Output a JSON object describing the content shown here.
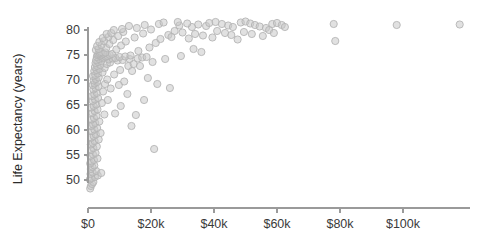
{
  "chart_data": {
    "type": "scatter",
    "title": "",
    "xlabel": "",
    "ylabel": "Life Expectancy (years)",
    "xlim": [
      -4000,
      123000
    ],
    "ylim": [
      46.5,
      82.5
    ],
    "grid": false,
    "legend": "none",
    "xticks": [
      0,
      20000,
      40000,
      60000,
      80000,
      100000
    ],
    "xticklabels": [
      "$0",
      "$20k",
      "$40k",
      "$60k",
      "$80k",
      "$100k"
    ],
    "yticks": [
      50,
      55,
      60,
      65,
      70,
      75,
      80
    ],
    "yticklabels": [
      "50",
      "55",
      "60",
      "65",
      "70",
      "75",
      "80"
    ],
    "marker": {
      "shape": "circle",
      "radius_px": 3.6,
      "fill": "#c9c9c9",
      "fill_opacity": 0.55,
      "stroke": "#b4b4b4",
      "stroke_width": 0.9
    },
    "axis_color": "#9a9a9a",
    "background": "#ffffff",
    "text_color": "#3a3a3a",
    "points": [
      [
        700,
        48.3
      ],
      [
        900,
        48.8
      ],
      [
        1300,
        49.2
      ],
      [
        1700,
        49.6
      ],
      [
        600,
        50.1
      ],
      [
        1100,
        50.4
      ],
      [
        2200,
        50.6
      ],
      [
        3100,
        50.9
      ],
      [
        800,
        51.2
      ],
      [
        1500,
        51.5
      ],
      [
        2600,
        51.8
      ],
      [
        4200,
        51.4
      ],
      [
        900,
        52.2
      ],
      [
        1400,
        52.6
      ],
      [
        2000,
        52.9
      ],
      [
        700,
        53.3
      ],
      [
        1200,
        53.7
      ],
      [
        1900,
        54.0
      ],
      [
        3000,
        54.3
      ],
      [
        800,
        54.8
      ],
      [
        1600,
        55.1
      ],
      [
        2400,
        55.4
      ],
      [
        21000,
        56.2
      ],
      [
        1000,
        56.0
      ],
      [
        1700,
        56.4
      ],
      [
        2800,
        56.7
      ],
      [
        900,
        57.1
      ],
      [
        1500,
        57.4
      ],
      [
        2100,
        57.8
      ],
      [
        3400,
        58.1
      ],
      [
        1100,
        58.5
      ],
      [
        1800,
        58.8
      ],
      [
        2500,
        59.1
      ],
      [
        4000,
        59.4
      ],
      [
        1300,
        59.8
      ],
      [
        2000,
        60.1
      ],
      [
        2900,
        60.4
      ],
      [
        1000,
        60.8
      ],
      [
        1600,
        61.1
      ],
      [
        2300,
        61.4
      ],
      [
        3600,
        61.7
      ],
      [
        1200,
        62.1
      ],
      [
        1900,
        62.4
      ],
      [
        2700,
        62.8
      ],
      [
        5200,
        63.1
      ],
      [
        1400,
        63.4
      ],
      [
        2100,
        63.8
      ],
      [
        3000,
        64.1
      ],
      [
        8600,
        63.3
      ],
      [
        1100,
        64.5
      ],
      [
        1800,
        64.8
      ],
      [
        2600,
        65.1
      ],
      [
        4400,
        65.4
      ],
      [
        1500,
        65.8
      ],
      [
        2200,
        66.1
      ],
      [
        3200,
        66.4
      ],
      [
        6300,
        66.0
      ],
      [
        1300,
        66.8
      ],
      [
        2000,
        67.1
      ],
      [
        2800,
        67.4
      ],
      [
        4800,
        67.7
      ],
      [
        1700,
        68.1
      ],
      [
        2400,
        68.4
      ],
      [
        3300,
        68.7
      ],
      [
        7200,
        68.3
      ],
      [
        1500,
        69.0
      ],
      [
        2100,
        69.3
      ],
      [
        2900,
        69.6
      ],
      [
        5400,
        69.2
      ],
      [
        9800,
        69.0
      ],
      [
        1800,
        69.9
      ],
      [
        2500,
        70.2
      ],
      [
        3400,
        70.5
      ],
      [
        6100,
        70.1
      ],
      [
        11500,
        69.7
      ],
      [
        1600,
        70.8
      ],
      [
        2300,
        71.0
      ],
      [
        3100,
        71.3
      ],
      [
        4600,
        71.5
      ],
      [
        8300,
        71.1
      ],
      [
        2000,
        71.8
      ],
      [
        2700,
        72.0
      ],
      [
        3600,
        72.2
      ],
      [
        5300,
        72.4
      ],
      [
        10200,
        72.0
      ],
      [
        2200,
        72.6
      ],
      [
        2900,
        72.8
      ],
      [
        3900,
        73.0
      ],
      [
        6000,
        73.2
      ],
      [
        12800,
        72.8
      ],
      [
        2400,
        73.4
      ],
      [
        3200,
        73.6
      ],
      [
        4200,
        73.8
      ],
      [
        7000,
        73.5
      ],
      [
        14500,
        73.2
      ],
      [
        2600,
        74.0
      ],
      [
        3500,
        74.2
      ],
      [
        4500,
        74.4
      ],
      [
        6600,
        74.1
      ],
      [
        9400,
        73.9
      ],
      [
        2800,
        74.6
      ],
      [
        3800,
        74.8
      ],
      [
        5000,
        74.5
      ],
      [
        7800,
        74.3
      ],
      [
        11000,
        74.0
      ],
      [
        3000,
        75.0
      ],
      [
        4000,
        74.9
      ],
      [
        5600,
        74.7
      ],
      [
        8700,
        74.4
      ],
      [
        13200,
        74.2
      ],
      [
        3300,
        75.2
      ],
      [
        4400,
        75.1
      ],
      [
        6200,
        74.8
      ],
      [
        10000,
        74.6
      ],
      [
        15800,
        74.3
      ],
      [
        3700,
        75.4
      ],
      [
        4900,
        75.3
      ],
      [
        6900,
        75.0
      ],
      [
        11800,
        74.7
      ],
      [
        17200,
        74.5
      ],
      [
        4100,
        75.6
      ],
      [
        5500,
        75.5
      ],
      [
        7600,
        75.2
      ],
      [
        13500,
        74.9
      ],
      [
        18600,
        74.6
      ],
      [
        2500,
        76.0
      ],
      [
        3400,
        76.2
      ],
      [
        5800,
        76.4
      ],
      [
        9000,
        76.1
      ],
      [
        16000,
        75.8
      ],
      [
        2900,
        76.8
      ],
      [
        4300,
        77.0
      ],
      [
        6800,
        77.2
      ],
      [
        10500,
        76.9
      ],
      [
        19500,
        76.5
      ],
      [
        3600,
        77.6
      ],
      [
        5100,
        77.8
      ],
      [
        8000,
        78.0
      ],
      [
        12000,
        77.7
      ],
      [
        21500,
        77.4
      ],
      [
        4700,
        78.4
      ],
      [
        6500,
        78.6
      ],
      [
        9600,
        78.8
      ],
      [
        14800,
        78.5
      ],
      [
        23000,
        78.2
      ],
      [
        5900,
        79.2
      ],
      [
        7400,
        79.4
      ],
      [
        11200,
        79.6
      ],
      [
        17500,
        79.3
      ],
      [
        25500,
        79.0
      ],
      [
        8200,
        80.0
      ],
      [
        10800,
        80.2
      ],
      [
        15500,
        80.4
      ],
      [
        20000,
        80.1
      ],
      [
        27500,
        79.8
      ],
      [
        13000,
        80.8
      ],
      [
        18000,
        81.0
      ],
      [
        22500,
        81.2
      ],
      [
        29000,
        80.9
      ],
      [
        33000,
        80.6
      ],
      [
        24000,
        81.5
      ],
      [
        28500,
        81.6
      ],
      [
        31500,
        81.3
      ],
      [
        35000,
        81.1
      ],
      [
        37500,
        80.8
      ],
      [
        30000,
        79.5
      ],
      [
        34000,
        79.2
      ],
      [
        36500,
        78.9
      ],
      [
        26500,
        78.6
      ],
      [
        32000,
        78.3
      ],
      [
        38500,
        81.4
      ],
      [
        40500,
        81.6
      ],
      [
        42500,
        81.2
      ],
      [
        44500,
        80.9
      ],
      [
        46000,
        80.6
      ],
      [
        41000,
        79.8
      ],
      [
        43500,
        79.4
      ],
      [
        45500,
        79.0
      ],
      [
        39500,
        78.5
      ],
      [
        47500,
        78.1
      ],
      [
        48500,
        81.5
      ],
      [
        50000,
        81.7
      ],
      [
        51500,
        81.3
      ],
      [
        53000,
        81.0
      ],
      [
        54500,
        80.7
      ],
      [
        49500,
        79.6
      ],
      [
        52000,
        79.2
      ],
      [
        55500,
        78.8
      ],
      [
        56500,
        80.4
      ],
      [
        57500,
        80.0
      ],
      [
        58500,
        81.2
      ],
      [
        60000,
        81.4
      ],
      [
        61500,
        81.0
      ],
      [
        62500,
        80.6
      ],
      [
        59000,
        79.4
      ],
      [
        33500,
        76.2
      ],
      [
        36000,
        75.6
      ],
      [
        29500,
        74.8
      ],
      [
        24500,
        74.2
      ],
      [
        20500,
        73.6
      ],
      [
        16500,
        72.8
      ],
      [
        14000,
        71.8
      ],
      [
        19000,
        70.4
      ],
      [
        22000,
        69.2
      ],
      [
        26000,
        68.4
      ],
      [
        12500,
        67.2
      ],
      [
        17800,
        66.0
      ],
      [
        10400,
        64.8
      ],
      [
        15200,
        63.0
      ],
      [
        13800,
        60.8
      ],
      [
        78000,
        81.2
      ],
      [
        78500,
        77.8
      ],
      [
        98000,
        81.0
      ],
      [
        118000,
        81.1
      ]
    ]
  },
  "geometry": {
    "plot_left_px": 88,
    "plot_right_px": 470,
    "axis_y_px": 208,
    "x_origin_px": 88,
    "x_scale_px_per_20k": 63,
    "y_top_px": 30,
    "y_px_per_unit": 5.0
  }
}
